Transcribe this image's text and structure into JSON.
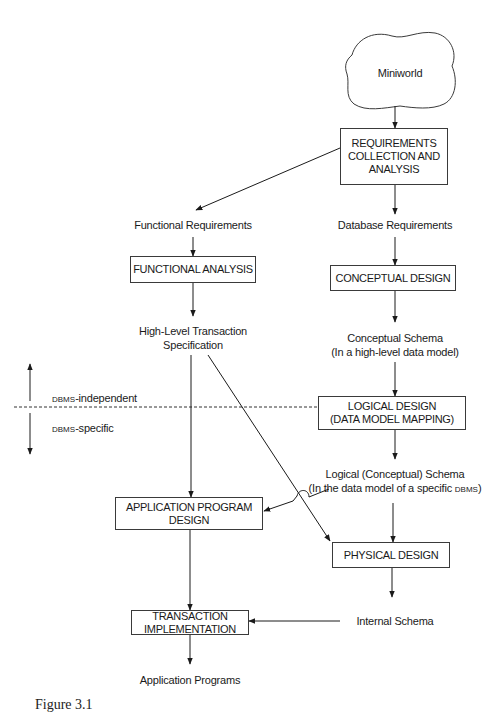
{
  "diagram": {
    "type": "database-design-process-flow",
    "nodes": {
      "miniworld": {
        "label": "Miniworld",
        "shape": "cloud"
      },
      "requirements": {
        "lines": [
          "REQUIREMENTS",
          "COLLECTION AND",
          "ANALYSIS"
        ],
        "shape": "box"
      },
      "functional_requirements": {
        "label": "Functional Requirements",
        "shape": "text"
      },
      "database_requirements": {
        "label": "Database Requirements",
        "shape": "text"
      },
      "functional_analysis": {
        "lines": [
          "FUNCTIONAL ANALYSIS"
        ],
        "shape": "box"
      },
      "conceptual_design": {
        "lines": [
          "CONCEPTUAL DESIGN"
        ],
        "shape": "box"
      },
      "high_level_spec": {
        "lines": [
          "High-Level Transaction",
          "Specification"
        ],
        "shape": "text"
      },
      "conceptual_schema": {
        "lines": [
          "Conceptual Schema",
          "(In a high-level data model)"
        ],
        "shape": "text"
      },
      "logical_design": {
        "lines": [
          "LOGICAL DESIGN",
          "(DATA MODEL MAPPING)"
        ],
        "shape": "box"
      },
      "logical_schema": {
        "line1": "Logical (Conceptual) Schema",
        "line2_prefix": "(In the data model of a specific ",
        "line2_sc": "DBMS",
        "line2_suffix": ")",
        "shape": "text"
      },
      "application_program_design": {
        "lines": [
          "APPLICATION PROGRAM",
          "DESIGN"
        ],
        "shape": "box"
      },
      "physical_design": {
        "lines": [
          "PHYSICAL DESIGN"
        ],
        "shape": "box"
      },
      "transaction_implementation": {
        "lines": [
          "TRANSACTION",
          "IMPLEMENTATION"
        ],
        "shape": "box"
      },
      "internal_schema": {
        "label": "Internal Schema",
        "shape": "text"
      },
      "application_programs": {
        "label": "Application Programs",
        "shape": "text"
      }
    },
    "edges": [
      {
        "from": "miniworld",
        "to": "requirements"
      },
      {
        "from": "requirements",
        "to": "functional_requirements"
      },
      {
        "from": "requirements",
        "to": "database_requirements"
      },
      {
        "from": "functional_requirements",
        "to": "functional_analysis"
      },
      {
        "from": "database_requirements",
        "to": "conceptual_design"
      },
      {
        "from": "functional_analysis",
        "to": "high_level_spec"
      },
      {
        "from": "conceptual_design",
        "to": "conceptual_schema"
      },
      {
        "from": "conceptual_schema",
        "to": "logical_design"
      },
      {
        "from": "logical_design",
        "to": "logical_schema"
      },
      {
        "from": "high_level_spec",
        "to": "application_program_design"
      },
      {
        "from": "high_level_spec",
        "to": "physical_design"
      },
      {
        "from": "logical_schema",
        "to": "application_program_design"
      },
      {
        "from": "logical_schema",
        "to": "physical_design"
      },
      {
        "from": "application_program_design",
        "to": "transaction_implementation"
      },
      {
        "from": "physical_design",
        "to": "internal_schema"
      },
      {
        "from": "internal_schema",
        "to": "transaction_implementation"
      },
      {
        "from": "transaction_implementation",
        "to": "application_programs"
      }
    ],
    "boundary": {
      "style": "dashed",
      "upper_sc": "DBMS",
      "upper_suffix": "-independent",
      "lower_sc": "DBMS",
      "lower_suffix": "-specific"
    },
    "caption_fragment": "Figure 3.1"
  }
}
